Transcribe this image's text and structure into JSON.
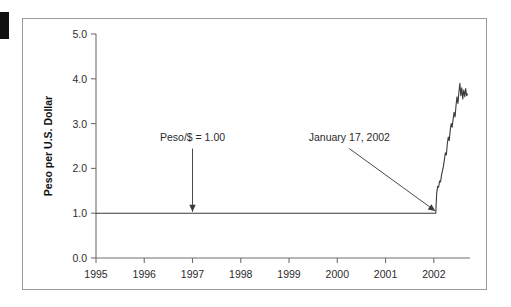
{
  "figure": {
    "marker_name": "page-edge-marker",
    "frame_color": "#9a9a9a"
  },
  "chart_data": {
    "type": "line",
    "title": "",
    "xlabel": "",
    "ylabel": "Peso per U.S. Dollar",
    "xlim": [
      1995.0,
      2002.75
    ],
    "ylim": [
      0.0,
      5.0
    ],
    "grid": false,
    "legend": "none",
    "xticks": [
      1995,
      1996,
      1997,
      1998,
      1999,
      2000,
      2001,
      2002
    ],
    "xtick_labels": [
      "1995",
      "1996",
      "1997",
      "1998",
      "1999",
      "2000",
      "2001",
      "2002"
    ],
    "yticks": [
      0.0,
      1.0,
      2.0,
      3.0,
      4.0,
      5.0
    ],
    "ytick_labels": [
      "0.0",
      "1.0",
      "2.0",
      "3.0",
      "4.0",
      "5.0"
    ],
    "series": [
      {
        "name": "Peso per U.S. Dollar",
        "color": "#3a3a3a",
        "x": [
          1995.0,
          1995.5,
          1996.0,
          1996.5,
          1997.0,
          1997.5,
          1998.0,
          1998.5,
          1999.0,
          1999.5,
          2000.0,
          2000.5,
          2001.0,
          2001.5,
          2001.9,
          2002.04,
          2002.06,
          2002.08,
          2002.1,
          2002.12,
          2002.14,
          2002.16,
          2002.18,
          2002.2,
          2002.22,
          2002.24,
          2002.26,
          2002.28,
          2002.3,
          2002.32,
          2002.34,
          2002.36,
          2002.38,
          2002.4,
          2002.42,
          2002.44,
          2002.46,
          2002.48,
          2002.5,
          2002.52,
          2002.54,
          2002.56,
          2002.58,
          2002.6,
          2002.62,
          2002.64,
          2002.66,
          2002.68,
          2002.7
        ],
        "y": [
          1.0,
          1.0,
          1.0,
          1.0,
          1.0,
          1.0,
          1.0,
          1.0,
          1.0,
          1.0,
          1.0,
          1.0,
          1.0,
          1.0,
          1.0,
          1.0,
          1.45,
          1.6,
          1.58,
          1.72,
          1.7,
          1.85,
          1.95,
          2.05,
          2.2,
          2.35,
          2.3,
          2.55,
          2.7,
          2.62,
          2.85,
          3.0,
          2.92,
          3.1,
          3.25,
          3.15,
          3.4,
          3.6,
          3.45,
          3.7,
          3.9,
          3.62,
          3.8,
          3.55,
          3.75,
          3.6,
          3.78,
          3.62,
          3.66
        ]
      }
    ],
    "annotations": [
      {
        "name": "peg-annotation",
        "text": "Peso/$ = 1.00",
        "x": 1997.0,
        "y": 2.62,
        "arrow_to_x": 1997.0,
        "arrow_to_y": 1.03
      },
      {
        "name": "devaluation-annotation",
        "text": "January 17, 2002",
        "x": 2000.25,
        "y": 2.62,
        "arrow_to_x": 2002.03,
        "arrow_to_y": 1.05
      }
    ]
  }
}
